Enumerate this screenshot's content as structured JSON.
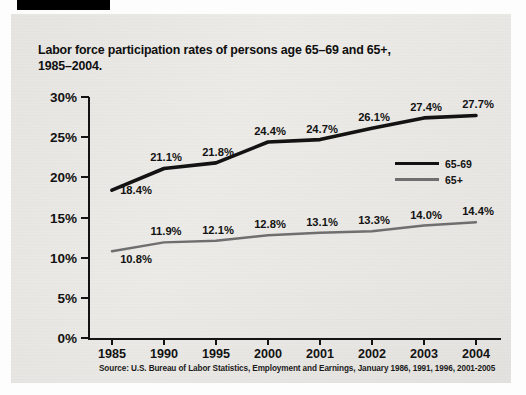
{
  "document": {
    "marker_bar": "black-redaction-bar"
  },
  "chart_data": {
    "type": "line",
    "title": "Labor force participation rates of persons age 65–69 and 65+,\n1985–2004.",
    "xlabel": "",
    "ylabel": "",
    "ylim": [
      0,
      30
    ],
    "ytick_labels": [
      "30%",
      "25%",
      "20%",
      "15%",
      "10%",
      "5%",
      "0%"
    ],
    "ytick_values": [
      30,
      25,
      20,
      15,
      10,
      5,
      0
    ],
    "grid": false,
    "categories": [
      "1985",
      "1990",
      "1995",
      "2000",
      "2001",
      "2002",
      "2003",
      "2004"
    ],
    "legend_position": "center-right",
    "series": [
      {
        "name": "65-69",
        "color": "#111111",
        "values": [
          18.4,
          21.1,
          21.8,
          24.4,
          24.7,
          26.1,
          27.4,
          27.7
        ],
        "labels": [
          "18.4%",
          "21.1%",
          "21.8%",
          "24.4%",
          "24.7%",
          "26.1%",
          "27.4%",
          "27.7%"
        ]
      },
      {
        "name": "65+",
        "color": "#6e6e6e",
        "values": [
          10.8,
          11.9,
          12.1,
          12.8,
          13.1,
          13.3,
          14.0,
          14.4
        ],
        "labels": [
          "10.8%",
          "11.9%",
          "12.1%",
          "12.8%",
          "13.1%",
          "13.3%",
          "14.0%",
          "14.4%"
        ]
      }
    ],
    "source_note": "Source: U.S. Bureau of Labor Statistics, Employment and Earnings, January 1986, 1991, 1996, 2001-2005"
  }
}
